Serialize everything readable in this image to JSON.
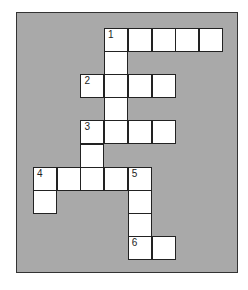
{
  "puzzle": {
    "colors": {
      "background": "#ffffff",
      "panel": "#a9a9a9",
      "cell": "#ffffff",
      "border": "#222222"
    },
    "grid": {
      "origin_x": 33,
      "origin_y": 27.5,
      "cell_w": 23.7,
      "cell_h": 23.2,
      "cells": [
        {
          "r": 0,
          "c": 3,
          "num": "1"
        },
        {
          "r": 0,
          "c": 4
        },
        {
          "r": 0,
          "c": 5
        },
        {
          "r": 0,
          "c": 6
        },
        {
          "r": 0,
          "c": 7
        },
        {
          "r": 1,
          "c": 3
        },
        {
          "r": 2,
          "c": 2,
          "num": "2"
        },
        {
          "r": 2,
          "c": 3
        },
        {
          "r": 2,
          "c": 4
        },
        {
          "r": 2,
          "c": 5
        },
        {
          "r": 3,
          "c": 3
        },
        {
          "r": 4,
          "c": 2,
          "num": "3"
        },
        {
          "r": 4,
          "c": 3
        },
        {
          "r": 4,
          "c": 4
        },
        {
          "r": 4,
          "c": 5
        },
        {
          "r": 5,
          "c": 2
        },
        {
          "r": 6,
          "c": 0,
          "num": "4"
        },
        {
          "r": 6,
          "c": 1
        },
        {
          "r": 6,
          "c": 2
        },
        {
          "r": 6,
          "c": 3
        },
        {
          "r": 6,
          "c": 4,
          "num": "5"
        },
        {
          "r": 7,
          "c": 0
        },
        {
          "r": 7,
          "c": 4
        },
        {
          "r": 8,
          "c": 4
        },
        {
          "r": 9,
          "c": 4,
          "num": "6"
        },
        {
          "r": 9,
          "c": 5
        }
      ]
    },
    "clue_numbers": [
      "1",
      "2",
      "3",
      "4",
      "5",
      "6"
    ]
  }
}
